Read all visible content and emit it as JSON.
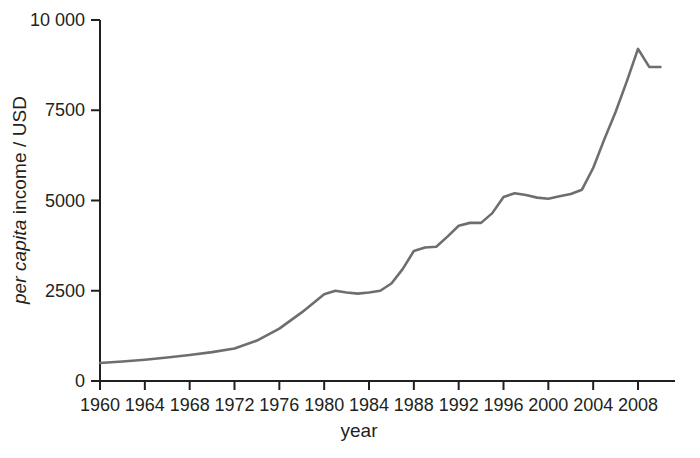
{
  "chart_data": {
    "type": "line",
    "title": "",
    "xlabel": "year",
    "ylabel_prefix": "per capita",
    "ylabel_suffix": " income / USD",
    "ylabel_full": "per capita income / USD",
    "xlim": [
      1960,
      2011
    ],
    "ylim": [
      0,
      10000
    ],
    "grid": false,
    "legend": null,
    "line_color": "#6e6e6e",
    "axis_color": "#231f20",
    "xticks": [
      1960,
      1964,
      1968,
      1972,
      1976,
      1980,
      1984,
      1988,
      1992,
      1996,
      2000,
      2004,
      2008
    ],
    "xtick_labels": [
      "1960",
      "1964",
      "1968",
      "1972",
      "1976",
      "1980",
      "1984",
      "1988",
      "1992",
      "1996",
      "2000",
      "2004",
      "2008"
    ],
    "yticks": [
      0,
      2500,
      5000,
      7500,
      10000
    ],
    "ytick_labels": [
      "0",
      "2500",
      "5000",
      "7500",
      "10 000"
    ],
    "x": [
      1960,
      1962,
      1964,
      1966,
      1968,
      1970,
      1972,
      1974,
      1976,
      1978,
      1980,
      1981,
      1982,
      1983,
      1984,
      1985,
      1986,
      1987,
      1988,
      1989,
      1990,
      1991,
      1992,
      1993,
      1994,
      1995,
      1996,
      1997,
      1998,
      1999,
      2000,
      2001,
      2002,
      2003,
      2004,
      2005,
      2006,
      2007,
      2008,
      2009,
      2010
    ],
    "y": [
      500,
      540,
      590,
      650,
      720,
      800,
      900,
      1120,
      1450,
      1900,
      2400,
      2500,
      2450,
      2420,
      2450,
      2500,
      2700,
      3100,
      3600,
      3700,
      3720,
      4000,
      4300,
      4380,
      4380,
      4650,
      5100,
      5200,
      5150,
      5080,
      5050,
      5120,
      5180,
      5300,
      5900,
      6700,
      7450,
      8300,
      9200,
      8700,
      8700
    ],
    "series_name": "per capita income"
  }
}
